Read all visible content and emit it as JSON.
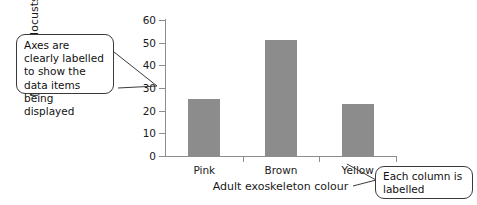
{
  "chart_data": {
    "type": "bar",
    "title": "",
    "categories": [
      "Pink",
      "Brown",
      "Yellow"
    ],
    "values": [
      25,
      51,
      23
    ],
    "series": [
      {
        "name": "Number of locusts",
        "values": [
          25,
          51,
          23
        ]
      }
    ],
    "xlabel": "Adult exoskeleton colour",
    "ylabel": "Number of locusts",
    "ylim": [
      0,
      60
    ],
    "ytick_values": [
      0,
      10,
      20,
      30,
      40,
      50,
      60
    ],
    "ytick_labels": [
      "0",
      "10",
      "20",
      "30",
      "40",
      "50",
      "60"
    ],
    "grid": false,
    "legend": false,
    "bar_color": "#8c8c8c",
    "axis_color": "#8d8d8d"
  },
  "axis": {
    "y_title": "Number of locusts",
    "x_title": "Adult exoskeleton colour",
    "y_ticks": [
      "0",
      "10",
      "20",
      "30",
      "40",
      "50",
      "60"
    ],
    "x_categories": [
      "Pink",
      "Brown",
      "Yellow"
    ]
  },
  "callouts": {
    "axes_note": "Axes are clearly labelled to show the data items being displayed",
    "column_note": "Each column is labelled"
  },
  "colors": {
    "bar": "#8c8c8c",
    "axis": "#8d8d8d",
    "text": "#1a1a1a",
    "callout_border": "#3a3a3a"
  }
}
